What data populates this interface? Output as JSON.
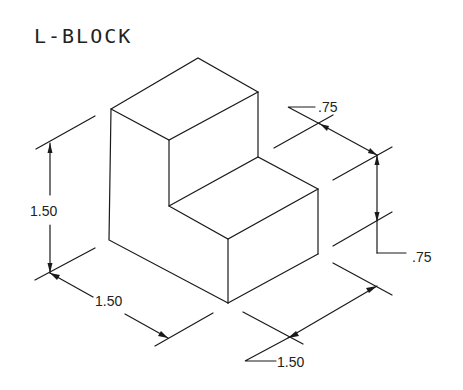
{
  "title": "L-BLOCK",
  "colors": {
    "line": "#1a1a1a",
    "text": "#222222",
    "background": "#ffffff"
  },
  "dimensions": {
    "height": {
      "label": "1.50",
      "description": "overall height (left vertical)"
    },
    "depth": {
      "label": "1.50",
      "description": "left-front depth (lower left)"
    },
    "width": {
      "label": "1.50",
      "description": "right-front width (lower right)"
    },
    "upper_step_depth": {
      "label": ".75",
      "description": "upper step depth (upper right)"
    },
    "step_height": {
      "label": ".75",
      "description": "lower step height (right vertical)"
    }
  }
}
